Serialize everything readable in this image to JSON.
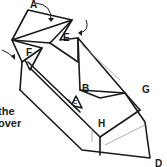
{
  "diagram": {
    "type": "origami-fold-step",
    "labels": {
      "a": "A",
      "b": "B",
      "c": "C",
      "d": "D",
      "e": "E",
      "f": "F",
      "g": "G",
      "h": "H"
    },
    "instruction_fragments": [
      "the",
      "over"
    ],
    "colors": {
      "line": "#1a1a1a",
      "thin_line": "#888888",
      "background": "#ffffff"
    }
  }
}
